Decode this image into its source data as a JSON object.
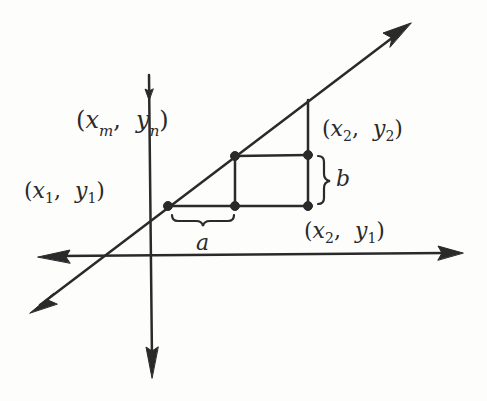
{
  "diagram": {
    "type": "coordinate-geometry",
    "colors": {
      "ink": "#2a2a2a",
      "background": "#fdfdfc"
    },
    "labels": {
      "midpoint": {
        "x": "x",
        "x_sub": "m",
        "y": "y",
        "y_sub": "n"
      },
      "point1": {
        "x": "x",
        "x_sub": "1",
        "y": "y",
        "y_sub": "1"
      },
      "point2": {
        "x": "x",
        "x_sub": "2",
        "y": "y",
        "y_sub": "2"
      },
      "point3": {
        "x": "x",
        "x_sub": "2",
        "y": "y",
        "y_sub": "1"
      },
      "run": "a",
      "rise": "b",
      "open_paren": "(",
      "close_paren": ")",
      "comma": ","
    }
  }
}
